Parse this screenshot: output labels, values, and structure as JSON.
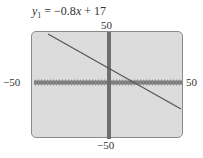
{
  "title": {
    "var": "y",
    "sub": "1",
    "rhs": "= −0.8",
    "x": "x",
    "tail": " + 17"
  },
  "labels": {
    "ymax": "50",
    "ymin": "−50",
    "xmin": "−50",
    "xmax": "50"
  },
  "colors": {
    "screen_bg": "#dcdcdc",
    "axis": "#6e6e6e",
    "line": "#555555"
  },
  "chart_data": {
    "type": "line",
    "title": "y1 = −0.8x + 17",
    "equation": {
      "slope": -0.8,
      "intercept": 17
    },
    "x": [
      -45,
      50
    ],
    "y": [
      53,
      -23
    ],
    "xlim": [
      -50,
      50
    ],
    "ylim": [
      -50,
      50
    ],
    "xlabel": "",
    "ylabel": "",
    "tick_labels": {
      "x": [
        "−50",
        "50"
      ],
      "y": [
        "−50",
        "50"
      ]
    },
    "grid": false,
    "legend": null
  }
}
